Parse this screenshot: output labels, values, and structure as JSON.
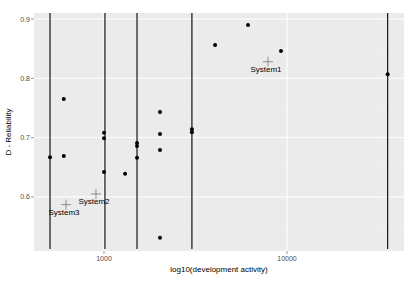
{
  "chart_data": {
    "type": "scatter",
    "title": "",
    "xlabel": "log10(development activity)",
    "ylabel": "D - Reliability",
    "x_scale": "log10",
    "xlim": [
      420,
      40000
    ],
    "ylim": [
      0.52,
      0.92
    ],
    "x_ticks": [
      {
        "value": 1000,
        "label": "1000"
      },
      {
        "value": 10000,
        "label": "10000"
      }
    ],
    "y_ticks": [
      {
        "value": 0.6,
        "label": "0.6"
      },
      {
        "value": 0.7,
        "label": "0.7"
      },
      {
        "value": 0.8,
        "label": "0.8"
      },
      {
        "value": 0.9,
        "label": "0.9"
      }
    ],
    "grid": true,
    "background": "#ebebeb",
    "vertical_lines": [
      507,
      1012,
      1515,
      3023,
      35500
    ],
    "points": [
      {
        "x": 603,
        "y": 0.765
      },
      {
        "x": 507,
        "y": 0.667
      },
      {
        "x": 603,
        "y": 0.669
      },
      {
        "x": 1000,
        "y": 0.708
      },
      {
        "x": 1000,
        "y": 0.699
      },
      {
        "x": 1000,
        "y": 0.642
      },
      {
        "x": 1304,
        "y": 0.639
      },
      {
        "x": 1515,
        "y": 0.691
      },
      {
        "x": 1515,
        "y": 0.686
      },
      {
        "x": 1515,
        "y": 0.666
      },
      {
        "x": 2023,
        "y": 0.743
      },
      {
        "x": 2023,
        "y": 0.706
      },
      {
        "x": 2023,
        "y": 0.679
      },
      {
        "x": 2023,
        "y": 0.531
      },
      {
        "x": 3023,
        "y": 0.714
      },
      {
        "x": 3023,
        "y": 0.709
      },
      {
        "x": 4045,
        "y": 0.856
      },
      {
        "x": 6123,
        "y": 0.89
      },
      {
        "x": 9270,
        "y": 0.846
      },
      {
        "x": 35500,
        "y": 0.807
      }
    ],
    "labeled_systems": [
      {
        "name": "System1",
        "x": 7870,
        "y": 0.828
      },
      {
        "name": "System2",
        "x": 904,
        "y": 0.605
      },
      {
        "name": "System3",
        "x": 620,
        "y": 0.587
      }
    ],
    "legend": null
  }
}
